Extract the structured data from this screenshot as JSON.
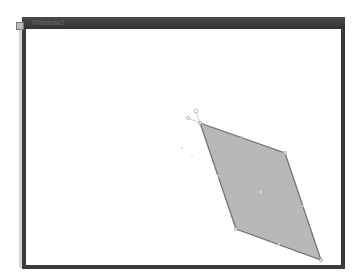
{
  "window": {
    "title": "Window1"
  },
  "canvas": {
    "shape": {
      "type": "quadrilateral",
      "fill": "#b8b8b8",
      "stroke": "#6e6e6e",
      "vertices": [
        [
          200,
          123
        ],
        [
          285,
          153
        ],
        [
          321,
          260
        ],
        [
          236,
          229
        ]
      ],
      "center": [
        261,
        192
      ]
    },
    "handles": {
      "rotation": [
        196,
        111
      ],
      "anchor": [
        188,
        118
      ]
    }
  }
}
